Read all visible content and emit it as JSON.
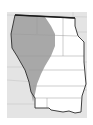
{
  "map": {
    "title": "",
    "region": "Great Plains",
    "colors": {
      "page_background": "#ffffff",
      "map_background": "#e4e4e4",
      "state_lines": "#c8c8c8",
      "region_fill": "#ffffff",
      "shaded_fill": "#a8a8a8",
      "outline": "#2a2a2a"
    },
    "legend": []
  }
}
